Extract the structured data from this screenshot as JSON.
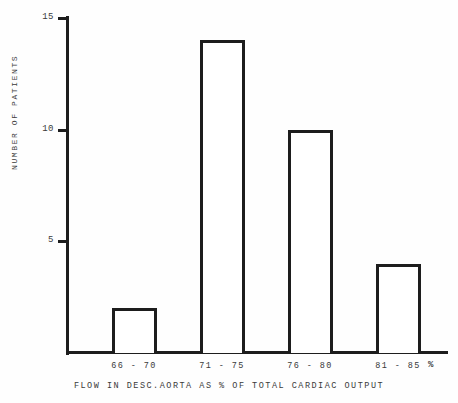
{
  "chart_data": {
    "type": "bar",
    "title": "",
    "xlabel": "FLOW IN DESC.AORTA AS % OF TOTAL CARDIAC OUTPUT",
    "ylabel": "NUMBER OF PATIENTS",
    "categories": [
      "66 - 70",
      "71 - 75",
      "76 - 80",
      "81 - 85"
    ],
    "values": [
      2,
      14,
      10,
      4
    ],
    "ylim": [
      0,
      15
    ],
    "yticks": [
      5,
      10,
      15
    ],
    "ytick_labels": [
      "5",
      "10",
      "15"
    ],
    "unit_marker": "%",
    "grid": false,
    "legend": null,
    "style": {
      "bar_fill": "#ffffff",
      "bar_outline": "#1d1d1d",
      "axis_color": "#1d1d1d",
      "text_color": "#3a3a3a",
      "background": "#fefefe"
    }
  }
}
